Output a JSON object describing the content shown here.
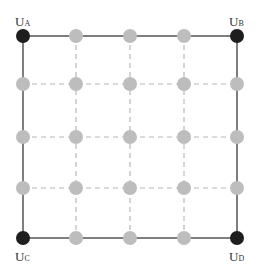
{
  "diagram": {
    "type": "grid-network",
    "rows": 5,
    "cols": 5,
    "colors": {
      "corner_node": "#1e1e1e",
      "inner_node": "#bdbdbd",
      "solid_edge": "#555555",
      "dashed_edge": "#b8b8b8"
    },
    "x_positions": [
      23,
      76,
      130,
      184,
      237
    ],
    "y_positions": [
      36,
      84,
      137,
      188,
      238
    ],
    "corners": [
      {
        "id": "UA",
        "main": "U",
        "sub": "A",
        "position": "top-left"
      },
      {
        "id": "UB",
        "main": "U",
        "sub": "B",
        "position": "top-right"
      },
      {
        "id": "UC",
        "main": "U",
        "sub": "C",
        "position": "bottom-left"
      },
      {
        "id": "UD",
        "main": "U",
        "sub": "D",
        "position": "bottom-right"
      }
    ]
  }
}
